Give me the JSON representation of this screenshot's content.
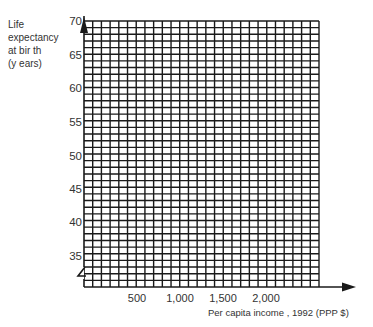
{
  "chart_data": {
    "type": "scatter",
    "title": "",
    "xlabel": "Per capita income   , 1992 (PPP $)",
    "ylabel": [
      "Life",
      "expectancy",
      "at bir th",
      "(y ears)"
    ],
    "x_ticks": [
      "500",
      "1,000",
      "1,500",
      "2,000"
    ],
    "x_tick_values": [
      500,
      1000,
      1500,
      2000
    ],
    "y_ticks": [
      "70",
      "65",
      "60",
      "55",
      "50",
      "45",
      "40",
      "35"
    ],
    "y_tick_values": [
      70,
      65,
      60,
      55,
      50,
      45,
      40,
      35
    ],
    "xlim": [
      0,
      2700
    ],
    "ylim": [
      30,
      70
    ],
    "grid": true,
    "grid_minor_x_step": 100,
    "grid_minor_y_step": 1,
    "axis_break_y": true,
    "series": [],
    "note": "Blank graph-paper grid for plotting; no data points shown"
  },
  "colors": {
    "grid": "#1a1a1a",
    "text": "#333333",
    "background": "#ffffff"
  }
}
